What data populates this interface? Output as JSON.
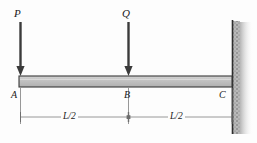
{
  "figure": {
    "type": "structural-beam-diagram",
    "background_color": "#fdfdfd",
    "beam_fill_color": "#bcbcbc",
    "beam_edge_color": "#3a3a3a",
    "line_color": "#4a4a4a",
    "wall_color": "#2e2e2e",
    "hatch_color": "#8d8d8d"
  },
  "loads": [
    {
      "label": "P",
      "x": 20,
      "label_x": 14,
      "label_y": 8,
      "arrow_top": 22,
      "arrow_tip": 76
    },
    {
      "label": "Q",
      "x": 128,
      "label_x": 122,
      "label_y": 8,
      "arrow_top": 22,
      "arrow_tip": 76
    }
  ],
  "nodes": [
    {
      "label": "A",
      "label_x": 11,
      "label_y": 90
    },
    {
      "label": "B",
      "label_x": 124,
      "label_y": 90
    },
    {
      "label": "C",
      "label_x": 219,
      "label_y": 90
    }
  ],
  "dimensions": [
    {
      "label": "L/2",
      "label_x": 61,
      "label_y": 112,
      "start_x": 20,
      "end_x": 128
    },
    {
      "label": "L/2",
      "label_x": 168,
      "label_y": 112,
      "start_x": 128,
      "end_x": 232
    }
  ],
  "beam": {
    "left_x": 19,
    "right_x": 232,
    "top_y": 76,
    "bottom_y": 87
  },
  "support": {
    "kind": "fixed-wall",
    "x": 232,
    "top_y": 20,
    "bottom_y": 134
  },
  "dimension_line_y": 117
}
